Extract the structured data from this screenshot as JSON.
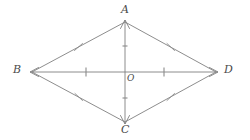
{
  "figure": {
    "kind": "rhombus-with-diagonals",
    "width": 250,
    "height": 140,
    "background_color": "#ffffff",
    "stroke_color": "#808080",
    "label_color": "#4a4a4a",
    "stroke_width": 0.9
  },
  "labels": {
    "A": "A",
    "B": "B",
    "C": "C",
    "D": "D",
    "O": "O"
  },
  "points": {
    "A": {
      "x": 125,
      "y": 22
    },
    "B": {
      "x": 32,
      "y": 72
    },
    "C": {
      "x": 125,
      "y": 122
    },
    "D": {
      "x": 216,
      "y": 72
    },
    "O": {
      "x": 125,
      "y": 72
    }
  },
  "sides": [
    {
      "name": "side-AB",
      "from": "B",
      "to": "A",
      "ticks": 1,
      "tick_style": "slanted"
    },
    {
      "name": "side-AD",
      "from": "A",
      "to": "D",
      "ticks": 1,
      "tick_style": "slanted"
    },
    {
      "name": "side-BC",
      "from": "B",
      "to": "C",
      "ticks": 1,
      "tick_style": "slanted"
    },
    {
      "name": "side-CD",
      "from": "C",
      "to": "D",
      "ticks": 1,
      "tick_style": "slanted"
    }
  ],
  "diagonals": [
    {
      "name": "diagonal-AC",
      "from": "A",
      "to": "C",
      "arrowheads": "both",
      "half_ticks": 1
    },
    {
      "name": "diagonal-BD",
      "from": "B",
      "to": "D",
      "arrowheads": "both",
      "half_ticks": 1
    }
  ]
}
